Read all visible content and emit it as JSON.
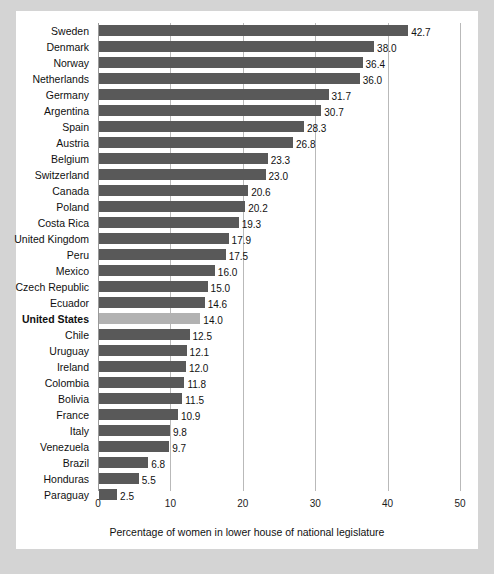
{
  "chart_data": {
    "type": "bar",
    "orientation": "horizontal",
    "title": "",
    "xlabel": "Percentage of women in lower house of national legislature",
    "ylabel": "",
    "xlim": [
      0,
      50
    ],
    "xticks": [
      0,
      10,
      20,
      30,
      40,
      50
    ],
    "xtick_labels": [
      "0",
      "10",
      "20",
      "30",
      "40",
      "50"
    ],
    "grid": true,
    "legend": "none",
    "highlight_category": "United States",
    "colors": {
      "bar": "#595959",
      "bar_highlight": "#b2b2b2",
      "gridline": "#b9b9b9",
      "panel_background": "#ffffff",
      "figure_background": "#d4d4d4",
      "text": "#111111"
    },
    "categories": [
      "Sweden",
      "Denmark",
      "Norway",
      "Netherlands",
      "Germany",
      "Argentina",
      "Spain",
      "Austria",
      "Belgium",
      "Switzerland",
      "Canada",
      "Poland",
      "Costa Rica",
      "United Kingdom",
      "Peru",
      "Mexico",
      "Czech Republic",
      "Ecuador",
      "United States",
      "Chile",
      "Uruguay",
      "Ireland",
      "Colombia",
      "Bolivia",
      "France",
      "Italy",
      "Venezuela",
      "Brazil",
      "Honduras",
      "Paraguay"
    ],
    "values": [
      42.7,
      38.0,
      36.4,
      36.0,
      31.7,
      30.7,
      28.3,
      26.8,
      23.3,
      23.0,
      20.6,
      20.2,
      19.3,
      17.9,
      17.5,
      16.0,
      15.0,
      14.6,
      14.0,
      12.5,
      12.1,
      12.0,
      11.8,
      11.5,
      10.9,
      9.8,
      9.7,
      6.8,
      5.5,
      2.5
    ],
    "value_labels": [
      "42.7",
      "38.0",
      "36.4",
      "36.0",
      "31.7",
      "30.7",
      "28.3",
      "26.8",
      "23.3",
      "23.0",
      "20.6",
      "20.2",
      "19.3",
      "17.9",
      "17.5",
      "16.0",
      "15.0",
      "14.6",
      "14.0",
      "12.5",
      "12.1",
      "12.0",
      "11.8",
      "11.5",
      "10.9",
      "9.8",
      "9.7",
      "6.8",
      "5.5",
      "2.5"
    ]
  }
}
